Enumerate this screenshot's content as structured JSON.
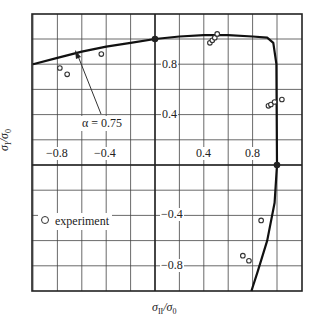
{
  "chart_data": {
    "type": "scatter",
    "title": "",
    "xlabel": "σII/σ0",
    "ylabel": "σI/σ0",
    "xlim": [
      -1.0,
      1.2
    ],
    "ylim": [
      -1.0,
      1.2
    ],
    "grid": true,
    "grid_step": 0.2,
    "x_tick_labels": [
      "-0.8",
      "-0.4",
      "0.4",
      "0.8"
    ],
    "y_tick_labels": [
      "0.8",
      "0.4",
      "-0.4",
      "-0.8"
    ],
    "legend": {
      "entries": [
        "experiment"
      ],
      "position": "lower-left",
      "marker": "open-circle"
    },
    "annotations": [
      {
        "text": "α = 0.75",
        "points_to": "yield curve",
        "arrow_tip": [
          -0.65,
          0.91
        ]
      }
    ],
    "highlighted_points": [
      {
        "x": 0.0,
        "y": 1.0
      },
      {
        "x": 1.0,
        "y": 0.0
      }
    ],
    "series": [
      {
        "name": "yield curve (α = 0.75)",
        "type": "line",
        "x": [
          -1.0,
          -0.8,
          -0.6,
          -0.4,
          -0.2,
          0.0,
          0.2,
          0.4,
          0.6,
          0.8,
          0.92,
          0.97,
          0.995,
          1.0,
          0.98,
          0.92,
          0.84,
          0.79
        ],
        "y": [
          0.8,
          0.85,
          0.9,
          0.94,
          0.97,
          1.0,
          1.02,
          1.03,
          1.03,
          1.02,
          1.01,
          0.97,
          0.8,
          0.0,
          -0.3,
          -0.6,
          -0.85,
          -1.0
        ]
      },
      {
        "name": "experiment",
        "type": "scatter",
        "x": [
          -0.78,
          -0.72,
          -0.44,
          0.45,
          0.47,
          0.49,
          0.51,
          0.93,
          0.95,
          0.98,
          1.04,
          0.87,
          0.72,
          0.77
        ],
        "y": [
          0.77,
          0.72,
          0.88,
          0.97,
          0.99,
          1.01,
          1.04,
          0.47,
          0.48,
          0.5,
          0.52,
          -0.44,
          -0.72,
          -0.76
        ]
      }
    ]
  },
  "labels": {
    "xlabel_main": "σ",
    "xlabel_sub": "II",
    "xlabel_rest": "/σ",
    "xlabel_sub2": "0",
    "ylabel_main": "σ",
    "ylabel_sub": "I",
    "ylabel_rest": "/σ",
    "ylabel_sub2": "0",
    "xticks": [
      "−0.8",
      "−0.4",
      "0.4",
      "0.8"
    ],
    "yticks": [
      "0.8",
      "0.4",
      "−0.4",
      "−0.8"
    ],
    "legend": "experiment",
    "annotation": "α = 0.75"
  }
}
